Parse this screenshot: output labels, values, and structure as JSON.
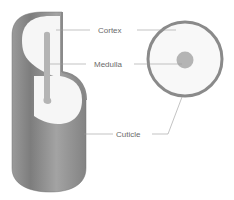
{
  "diagram": {
    "views": [
      "cut-away cylinder",
      "cross-section"
    ],
    "labels": {
      "cortex": "Cortex",
      "medulla": "Medulla",
      "cuticle": "Cuticle"
    },
    "colors": {
      "background": "#ffffff",
      "cuticle": "#8a8a8a",
      "cortex": "#f6f6f6",
      "medulla": "#b4b4b4",
      "leader_line": "#9a9a9a",
      "label_text": "#6a6a6a"
    }
  }
}
